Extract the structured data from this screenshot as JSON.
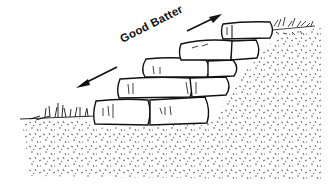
{
  "illustration": {
    "subject": "stone retaining wall leaning into slope",
    "annotation": {
      "label": "Good Batter",
      "arrow": "double-headed-diagonal"
    },
    "colors": {
      "ink": "#111111",
      "background": "#ffffff"
    }
  }
}
